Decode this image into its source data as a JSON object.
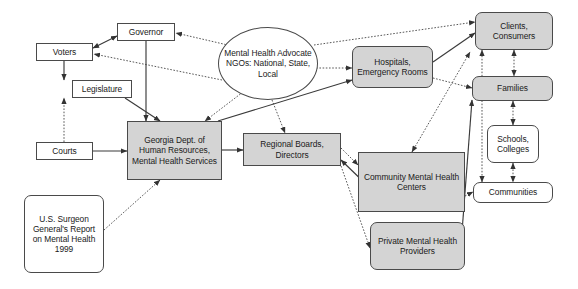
{
  "diagram": {
    "colors": {
      "shaded_fill": "#d4d4d4",
      "plain_fill": "#ffffff",
      "stroke": "#4a4a4a",
      "text": "#1a1a1a",
      "background": "#ffffff"
    },
    "nodes": [
      {
        "id": "voters",
        "label": "Voters",
        "shape": "rect",
        "fill": "plain",
        "x": 36,
        "y": 43,
        "w": 57,
        "h": 18
      },
      {
        "id": "governor",
        "label": "Governor",
        "shape": "rect",
        "fill": "plain",
        "x": 117,
        "y": 23,
        "w": 58,
        "h": 18
      },
      {
        "id": "legislature",
        "label": "Legislature",
        "shape": "rect",
        "fill": "plain",
        "x": 72,
        "y": 80,
        "w": 60,
        "h": 18
      },
      {
        "id": "courts",
        "label": "Courts",
        "shape": "rect",
        "fill": "plain",
        "x": 36,
        "y": 142,
        "w": 57,
        "h": 18
      },
      {
        "id": "surgeon",
        "label": "U.S. Surgeon General's Report on Mental Health 1999",
        "shape": "round",
        "fill": "plain",
        "x": 24,
        "y": 195,
        "w": 80,
        "h": 78
      },
      {
        "id": "ngo",
        "label": "Mental Health Advocate NGOs: National, State, Local",
        "shape": "ellipse",
        "fill": "plain",
        "x": 218,
        "y": 27,
        "w": 100,
        "h": 73
      },
      {
        "id": "gadhr",
        "label": "Georgia Dept. of Human Resources, Mental Health Services",
        "shape": "rect",
        "fill": "shaded",
        "x": 127,
        "y": 121,
        "w": 95,
        "h": 59
      },
      {
        "id": "regional",
        "label": "Regional Boards, Directors",
        "shape": "rect",
        "fill": "shaded",
        "x": 243,
        "y": 133,
        "w": 98,
        "h": 33
      },
      {
        "id": "hospitals",
        "label": "Hospitals, Emergency Rooms",
        "shape": "round",
        "fill": "shaded",
        "x": 352,
        "y": 46,
        "w": 81,
        "h": 42
      },
      {
        "id": "cmhc",
        "label": "Community Mental Health Centers",
        "shape": "rect",
        "fill": "shaded",
        "x": 358,
        "y": 152,
        "w": 107,
        "h": 60
      },
      {
        "id": "private",
        "label": "Private Mental Health Providers",
        "shape": "round",
        "fill": "shaded",
        "x": 370,
        "y": 222,
        "w": 95,
        "h": 48
      },
      {
        "id": "clients",
        "label": "Clients, Consumers",
        "shape": "round",
        "fill": "shaded",
        "x": 475,
        "y": 12,
        "w": 78,
        "h": 38
      },
      {
        "id": "families",
        "label": "Families",
        "shape": "round",
        "fill": "shaded",
        "x": 472,
        "y": 76,
        "w": 81,
        "h": 25
      },
      {
        "id": "schools",
        "label": "Schools, Colleges",
        "shape": "round",
        "fill": "plain",
        "x": 487,
        "y": 125,
        "w": 52,
        "h": 38
      },
      {
        "id": "communities",
        "label": "Communities",
        "shape": "round",
        "fill": "plain",
        "x": 473,
        "y": 182,
        "w": 80,
        "h": 21
      }
    ],
    "edges": [
      {
        "from": "voters",
        "to": "governor",
        "style": "solid",
        "arrows": "both",
        "points": "93,48 117,36"
      },
      {
        "from": "governor",
        "to": "gadhr",
        "style": "solid",
        "arrows": "end",
        "points": "146,41 146,121"
      },
      {
        "from": "voters",
        "to": "legislature",
        "style": "solid",
        "arrows": "end",
        "points": "64,61 64,80"
      },
      {
        "from": "legislature",
        "to": "gadhr",
        "style": "solid",
        "arrows": "end",
        "points": "125,98 160,121"
      },
      {
        "from": "courts",
        "to": "legislature",
        "style": "dotted",
        "arrows": "end",
        "points": "64,142 64,98"
      },
      {
        "from": "courts",
        "to": "gadhr",
        "style": "solid",
        "arrows": "end",
        "points": "93,151 127,151"
      },
      {
        "from": "surgeon",
        "to": "gadhr",
        "style": "dotted",
        "arrows": "end",
        "points": "104,230 160,180"
      },
      {
        "from": "ngo",
        "to": "voters",
        "style": "dotted",
        "arrows": "end",
        "points": "222,80 94,54"
      },
      {
        "from": "ngo",
        "to": "governor",
        "style": "dotted",
        "arrows": "end",
        "points": "232,46 176,33"
      },
      {
        "from": "ngo",
        "to": "gadhr",
        "style": "dotted",
        "arrows": "end",
        "points": "243,92 205,121"
      },
      {
        "from": "ngo",
        "to": "regional",
        "style": "dotted",
        "arrows": "end",
        "points": "272,100 285,133"
      },
      {
        "from": "ngo",
        "to": "clients",
        "style": "dotted",
        "arrows": "end",
        "points": "314,45 475,22"
      },
      {
        "from": "ngo",
        "to": "hospitals",
        "style": "dotted",
        "arrows": "end",
        "points": "313,68 352,68"
      },
      {
        "from": "gadhr",
        "to": "regional",
        "style": "solid",
        "arrows": "end",
        "points": "222,150 243,150"
      },
      {
        "from": "gadhr",
        "to": "hospitals",
        "style": "solid",
        "arrows": "end",
        "points": "218,121 352,80"
      },
      {
        "from": "regional",
        "to": "cmhc",
        "style": "solid",
        "arrows": "both",
        "points": "341,160 372,190"
      },
      {
        "from": "regional",
        "to": "cmhc",
        "style": "dotted",
        "arrows": "end",
        "points": "341,148 358,165"
      },
      {
        "from": "regional",
        "to": "private",
        "style": "dotted",
        "arrows": "end",
        "points": "341,166 370,248"
      },
      {
        "from": "hospitals",
        "to": "clients",
        "style": "solid",
        "arrows": "end",
        "points": "433,62 475,33"
      },
      {
        "from": "hospitals",
        "to": "families",
        "style": "dotted",
        "arrows": "end",
        "points": "433,78 472,88"
      },
      {
        "from": "cmhc",
        "to": "clients",
        "style": "dotted",
        "arrows": "both",
        "points": "412,152 470,52"
      },
      {
        "from": "cmhc",
        "to": "communities",
        "style": "dotted",
        "arrows": "end",
        "points": "465,196 473,192"
      },
      {
        "from": "private",
        "to": "families",
        "style": "solid",
        "arrows": "end",
        "points": "462,232 472,100"
      },
      {
        "from": "clients",
        "to": "families",
        "style": "dotted",
        "arrows": "both",
        "points": "514,50 514,76"
      },
      {
        "from": "families",
        "to": "schools",
        "style": "dotted",
        "arrows": "both",
        "points": "513,101 513,125"
      },
      {
        "from": "schools",
        "to": "communities",
        "style": "dotted",
        "arrows": "both",
        "points": "513,163 513,182"
      },
      {
        "from": "communities",
        "to": "clients",
        "style": "dotted",
        "arrows": "both",
        "points": "482,182 482,50"
      }
    ]
  }
}
